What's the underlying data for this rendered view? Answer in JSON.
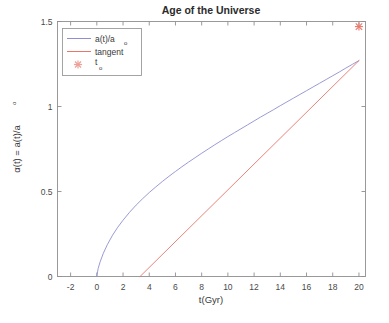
{
  "figure": {
    "background_color": "#ffffff",
    "axes_color": "#8f8f8f"
  },
  "chart_data": {
    "type": "line",
    "title": "Age of the Universe",
    "xlabel": "t(Gyr)",
    "ylabel": "α(t) = a(t)/aₒ",
    "ylabel_main": "α(t) = a(t)/a",
    "ylabel_sub": "o",
    "xlim": [
      -3,
      20.5
    ],
    "ylim": [
      0,
      1.5
    ],
    "xticks": [
      -2,
      0,
      2,
      4,
      6,
      8,
      10,
      12,
      14,
      16,
      18,
      20
    ],
    "xticklabels": [
      "-2",
      "0",
      "2",
      "4",
      "6",
      "8",
      "10",
      "12",
      "14",
      "16",
      "18",
      "20"
    ],
    "yticks": [
      0,
      0.5,
      1,
      1.5
    ],
    "yticklabels": [
      "0",
      "0.5",
      "1",
      "1.5"
    ],
    "grid": false,
    "legend_position": "upper left",
    "series": [
      {
        "name": "a(t)/aₒ",
        "label_main": "a(t)/a",
        "label_sub": "o",
        "type": "line",
        "color": "#8f8fd0",
        "linewidth": 0.9,
        "x": [
          0,
          0.1,
          0.25,
          0.5,
          0.8,
          1.2,
          1.6,
          2,
          2.5,
          3,
          3.5,
          4,
          4.5,
          5,
          5.5,
          6,
          6.5,
          7,
          7.5,
          8,
          8.5,
          9,
          9.5,
          10,
          10.5,
          11,
          11.5,
          12,
          12.5,
          13,
          13.5,
          14,
          14.5,
          15,
          15.5,
          16,
          16.5,
          17,
          17.5,
          18,
          18.5,
          19,
          19.5,
          20
        ],
        "y": [
          0,
          0.047,
          0.086,
          0.137,
          0.187,
          0.243,
          0.29,
          0.331,
          0.378,
          0.42,
          0.458,
          0.494,
          0.527,
          0.559,
          0.589,
          0.618,
          0.646,
          0.673,
          0.699,
          0.725,
          0.75,
          0.775,
          0.799,
          0.823,
          0.846,
          0.869,
          0.892,
          0.915,
          0.938,
          0.96,
          0.982,
          1.005,
          1.027,
          1.049,
          1.071,
          1.093,
          1.115,
          1.137,
          1.159,
          1.181,
          1.203,
          1.226,
          1.248,
          1.27
        ]
      },
      {
        "name": "tangent",
        "label_main": "tangent",
        "label_sub": "",
        "type": "line",
        "color": "#e8766a",
        "linewidth": 0.9,
        "x": [
          3.3,
          20
        ],
        "y": [
          0,
          1.27
        ]
      },
      {
        "name": "tₒ",
        "label_main": "t",
        "label_sub": "o",
        "type": "marker",
        "color": "#e8766a",
        "marker": "asterisk",
        "x": [
          20
        ],
        "y": [
          1.47
        ]
      }
    ],
    "annotations": [
      {
        "name": "curve-peak",
        "note": "a(t)/aₒ and tangent converge near t=20, α≈1.47"
      }
    ]
  },
  "legend": {
    "entries": [
      {
        "label_main": "a(t)/a",
        "label_sub": "o",
        "kind": "line",
        "color": "#8f8fd0"
      },
      {
        "label_main": "tangent",
        "label_sub": "",
        "kind": "line",
        "color": "#e8766a"
      },
      {
        "label_main": "t",
        "label_sub": "o",
        "kind": "marker",
        "color": "#e8766a"
      }
    ]
  }
}
